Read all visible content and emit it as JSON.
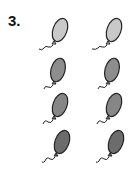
{
  "exercise": {
    "number": "3."
  },
  "balloons": [
    {
      "row": 1,
      "col": 1,
      "shade": "light",
      "fill": "#c9c9c9"
    },
    {
      "row": 1,
      "col": 2,
      "shade": "light",
      "fill": "#c9c9c9"
    },
    {
      "row": 2,
      "col": 1,
      "shade": "medium",
      "fill": "#8d8d8d"
    },
    {
      "row": 2,
      "col": 2,
      "shade": "medium",
      "fill": "#8d8d8d"
    },
    {
      "row": 3,
      "col": 1,
      "shade": "medium",
      "fill": "#868686"
    },
    {
      "row": 3,
      "col": 2,
      "shade": "medium",
      "fill": "#868686"
    },
    {
      "row": 4,
      "col": 1,
      "shade": "dark",
      "fill": "#6c6c6c"
    },
    {
      "row": 4,
      "col": 2,
      "shade": "dark",
      "fill": "#6c6c6c"
    }
  ]
}
